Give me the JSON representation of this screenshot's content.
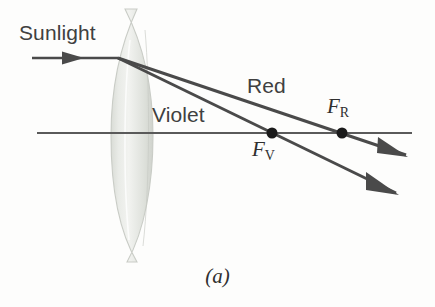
{
  "figure": {
    "caption": "(a)",
    "background_color": "#fdfdfc"
  },
  "labels": {
    "sunlight": "Sunlight",
    "red": "Red",
    "violet": "Violet",
    "focal_red": "F",
    "focal_red_sub": "R",
    "focal_violet": "F",
    "focal_violet_sub": "V"
  },
  "colors": {
    "ray": "#4a4a4a",
    "axis": "#5a5a5a",
    "lens_fill": "#e6e8e4",
    "lens_edge": "#c9ccc6",
    "text": "#404040",
    "dot": "#1a1a1a"
  },
  "geometry": {
    "lens": {
      "center_x": 132,
      "top_y": 8,
      "bottom_y": 263,
      "half_width": 21
    },
    "optical_axis": {
      "y": 133,
      "x_start": 37,
      "x_end": 412
    },
    "incoming_ray": {
      "y": 58,
      "x_start": 32,
      "x_end": 118,
      "arrow_x": 78
    },
    "vertex": {
      "x": 118,
      "y": 58
    },
    "red_ray": {
      "focus_x": 342,
      "focus_y": 133,
      "end_x": 406,
      "end_y": 155
    },
    "violet_ray": {
      "focus_x": 272,
      "focus_y": 133,
      "end_x": 396,
      "end_y": 193
    },
    "focal_dot_radius": 5.5
  }
}
